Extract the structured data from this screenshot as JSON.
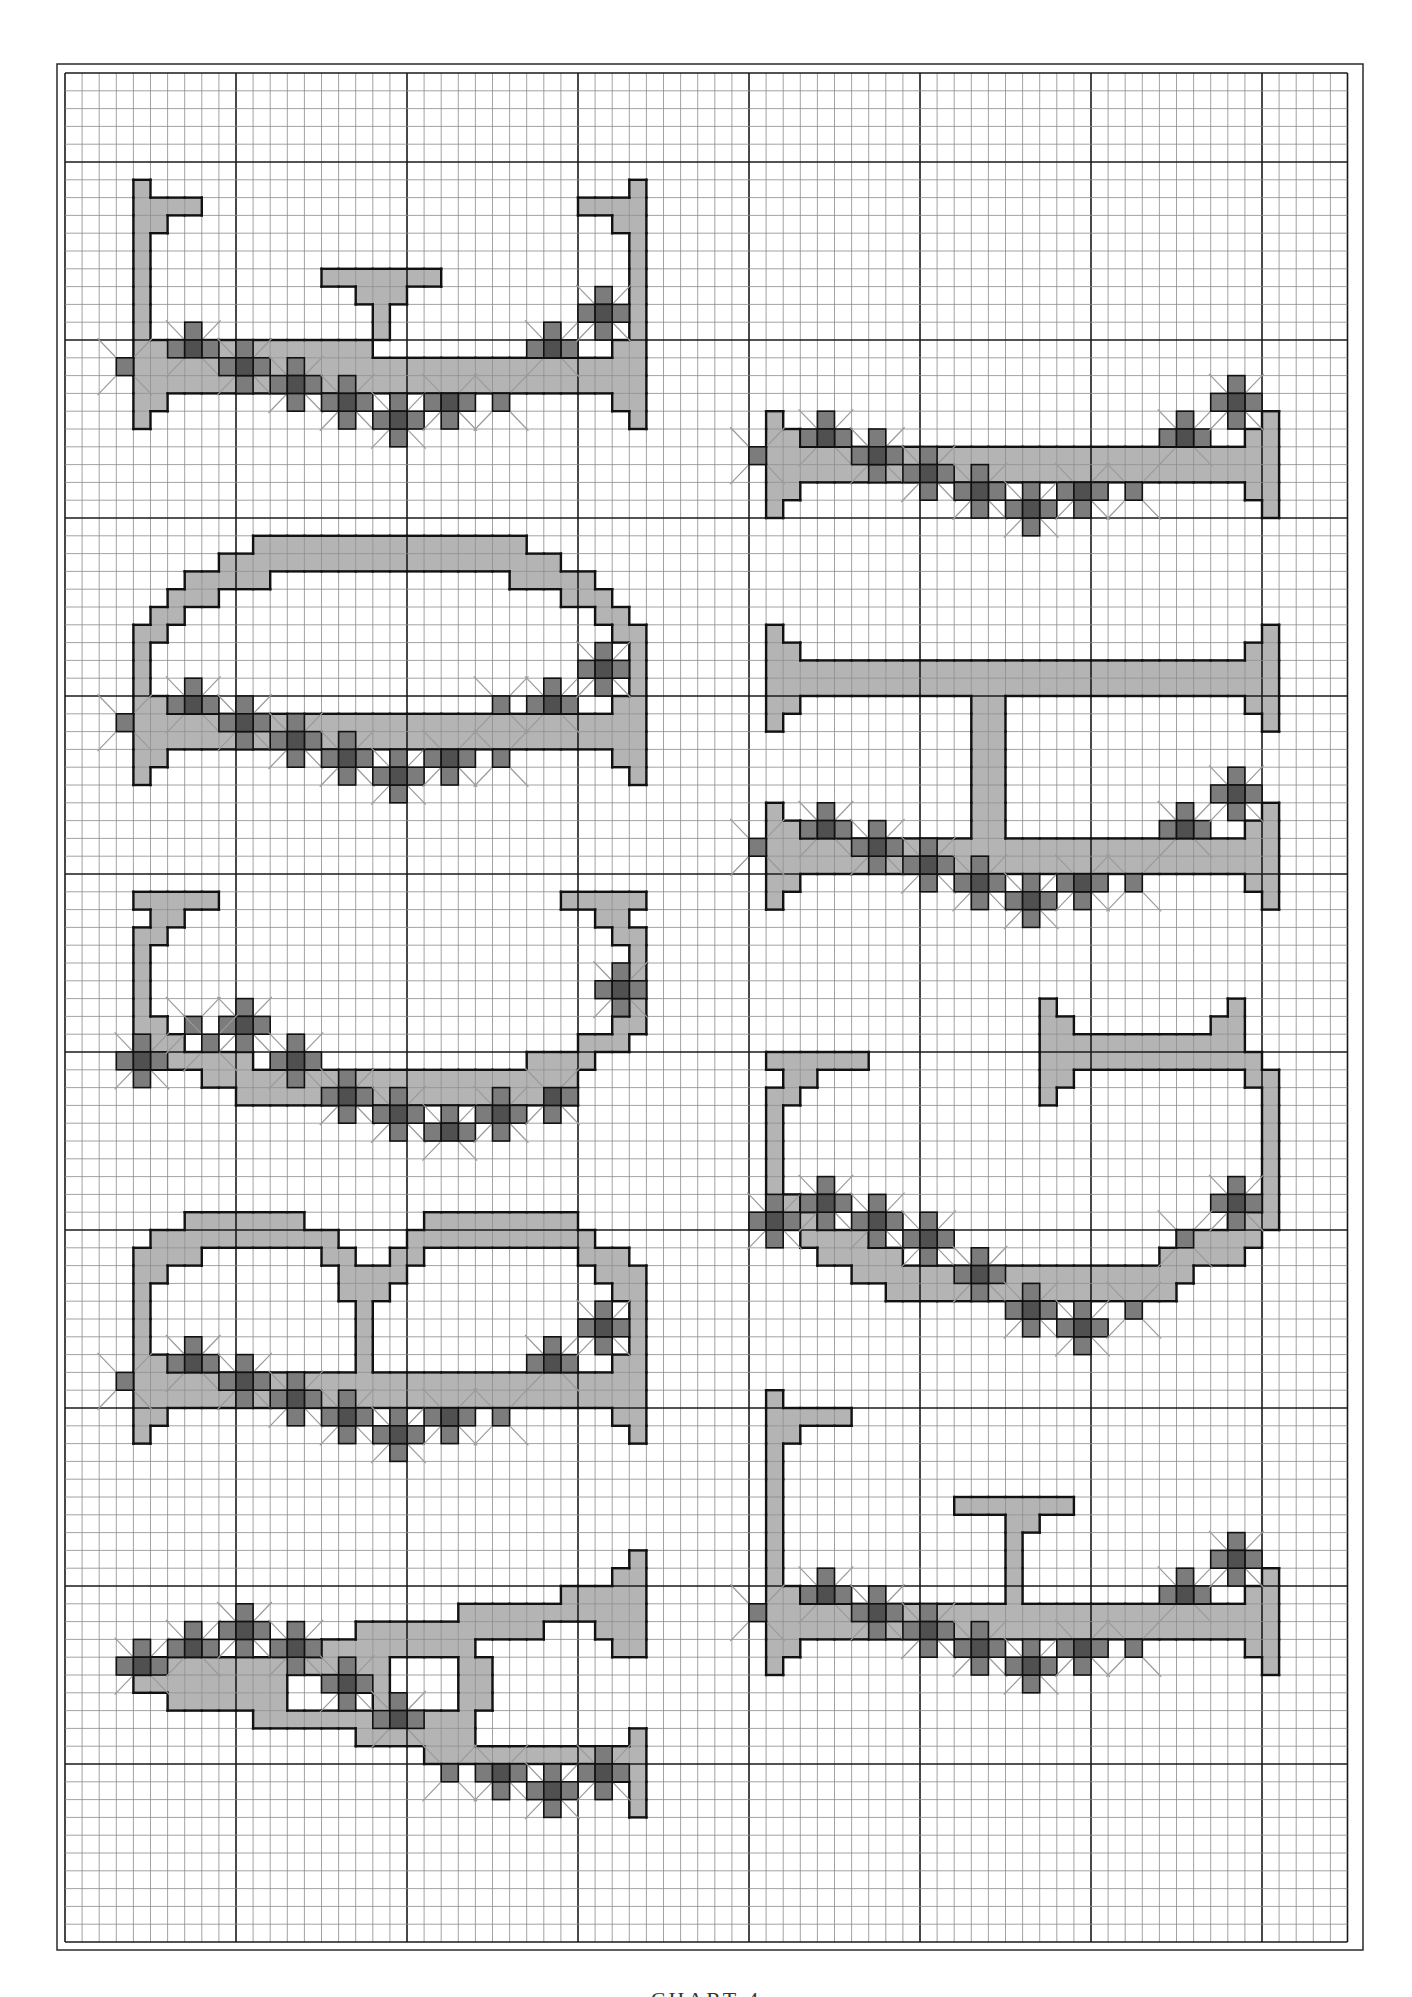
{
  "page": {
    "caption": "CHART 4",
    "colors": {
      "background": "#ffffff",
      "grid_minor": "#8a8a8a",
      "grid_major": "#1a1a1a",
      "frame": "#2a2a2a",
      "fill_light": "#b4b4b4",
      "stitch_medium": "#7c7c7c",
      "stitch_dark": "#505050",
      "outline": "#111111",
      "backstitch": "#9a9a9a"
    }
  },
  "grid": {
    "x0": 65,
    "y0": 73,
    "cell_w": 17.1,
    "cell_h": 17.8,
    "cols": 75,
    "rows": 105,
    "major_every": 10,
    "major_row_offset": 5,
    "frame": {
      "x": 57,
      "y": 64,
      "w": 1306,
      "h": 1886
    }
  },
  "flower_pattern": {
    "description": "shared border of flower clusters relative to (origin col, bar row R)",
    "singles": [
      [
        0,
        0
      ],
      [
        22,
        2
      ]
    ],
    "flowers": [
      [
        4,
        -1,
        "tlr"
      ],
      [
        7,
        0,
        "tlrb"
      ],
      [
        10,
        1,
        "tlrb"
      ],
      [
        13,
        2,
        "tlrb"
      ],
      [
        16,
        3,
        "tlrb"
      ],
      [
        19,
        2,
        "lrb"
      ],
      [
        25,
        -1,
        "tlr"
      ],
      [
        28,
        -3,
        "tlrb"
      ]
    ],
    "bench_spans": [
      [
        0,
        1,
        30
      ],
      [
        1,
        1,
        30
      ],
      [
        -1,
        1,
        2
      ],
      [
        -1,
        29,
        30
      ],
      [
        2,
        1,
        2
      ],
      [
        2,
        29,
        30
      ],
      [
        3,
        1,
        1
      ],
      [
        3,
        30,
        30
      ],
      [
        -2,
        1,
        1
      ],
      [
        -2,
        30,
        30
      ]
    ]
  },
  "motifs": [
    {
      "name": "bench-t-top-left",
      "col": 3,
      "R": 16,
      "pattern": true,
      "spans": [
        [
          -10,
          1,
          1
        ],
        [
          -9,
          1,
          4
        ],
        [
          -8,
          1,
          2
        ],
        [
          -7,
          1,
          1
        ],
        [
          -6,
          1,
          1
        ],
        [
          -5,
          1,
          1
        ],
        [
          -4,
          1,
          1
        ],
        [
          -3,
          1,
          1
        ],
        [
          -10,
          30,
          30
        ],
        [
          -9,
          27,
          30
        ],
        [
          -8,
          29,
          30
        ],
        [
          -7,
          30,
          30
        ],
        [
          -6,
          30,
          30
        ],
        [
          -5,
          30,
          30
        ],
        [
          -4,
          30,
          30
        ],
        [
          -3,
          30,
          30
        ],
        [
          -5,
          12,
          18
        ],
        [
          -4,
          14,
          16
        ],
        [
          -3,
          15,
          15
        ],
        [
          -2,
          15,
          15
        ],
        [
          -1,
          1,
          14
        ]
      ],
      "flowers": [],
      "singles": []
    },
    {
      "name": "bench-right-1",
      "col": 40,
      "R": 21,
      "pattern": true,
      "spans": [],
      "flowers": [],
      "singles": []
    },
    {
      "name": "bench-arch-left",
      "col": 3,
      "R": 36,
      "pattern": true,
      "spans": [
        [
          -10,
          8,
          23
        ],
        [
          -9,
          6,
          25
        ],
        [
          -8,
          4,
          8
        ],
        [
          -8,
          23,
          27
        ],
        [
          -7,
          3,
          5
        ],
        [
          -7,
          26,
          28
        ],
        [
          -6,
          2,
          3
        ],
        [
          -6,
          28,
          29
        ],
        [
          -5,
          1,
          2
        ],
        [
          -5,
          29,
          30
        ],
        [
          -4,
          1,
          1
        ],
        [
          -4,
          30,
          30
        ],
        [
          -3,
          1,
          1
        ],
        [
          -3,
          30,
          30
        ]
      ],
      "flowers": [],
      "singles": [
        [
          22,
          -1
        ]
      ]
    },
    {
      "name": "bench-h-frame-right",
      "col": 40,
      "R": 43,
      "pattern": true,
      "spans": [
        [
          -12,
          1,
          1
        ],
        [
          -11,
          1,
          2
        ],
        [
          -10,
          1,
          30
        ],
        [
          -9,
          1,
          30
        ],
        [
          -8,
          1,
          2
        ],
        [
          -7,
          1,
          1
        ],
        [
          -12,
          30,
          30
        ],
        [
          -11,
          29,
          30
        ],
        [
          -8,
          29,
          30
        ],
        [
          -7,
          30,
          30
        ],
        [
          -8,
          13,
          14
        ],
        [
          -7,
          13,
          14
        ],
        [
          -6,
          13,
          14
        ],
        [
          -5,
          13,
          14
        ],
        [
          -4,
          13,
          14
        ],
        [
          -3,
          13,
          14
        ],
        [
          -2,
          13,
          14
        ],
        [
          -1,
          13,
          14
        ]
      ],
      "flowers": [],
      "singles": []
    },
    {
      "name": "bowl-left",
      "col": 3,
      "R": 55,
      "pattern": false,
      "spans": [
        [
          -9,
          1,
          5
        ],
        [
          -9,
          26,
          30
        ],
        [
          -8,
          2,
          3
        ],
        [
          -8,
          28,
          29
        ],
        [
          -7,
          1,
          2
        ],
        [
          -7,
          29,
          30
        ],
        [
          -6,
          1,
          1
        ],
        [
          -6,
          30,
          30
        ],
        [
          -5,
          1,
          1
        ],
        [
          -5,
          30,
          30
        ],
        [
          -4,
          1,
          1
        ],
        [
          -4,
          30,
          30
        ],
        [
          -3,
          1,
          1
        ],
        [
          -3,
          30,
          30
        ],
        [
          -2,
          1,
          2
        ],
        [
          -2,
          29,
          30
        ],
        [
          -1,
          1,
          3
        ],
        [
          -1,
          27,
          29
        ],
        [
          0,
          2,
          7
        ],
        [
          0,
          24,
          27
        ],
        [
          1,
          5,
          26
        ],
        [
          2,
          7,
          26
        ]
      ],
      "flowers": [
        [
          1,
          0,
          "tlrb"
        ],
        [
          7,
          -2,
          "tlrb"
        ],
        [
          10,
          0,
          "tlrb"
        ],
        [
          13,
          2,
          "tlrb"
        ],
        [
          16,
          3,
          "tlrb"
        ],
        [
          19,
          4,
          "tlr"
        ],
        [
          22,
          3,
          "tlrb"
        ],
        [
          25,
          2,
          "rb"
        ],
        [
          29,
          -4,
          "tlrb"
        ]
      ],
      "singles": [
        [
          4,
          -2
        ],
        [
          5,
          -1
        ]
      ]
    },
    {
      "name": "hoop-h-top-right",
      "col": 40,
      "R": 64,
      "pattern": false,
      "spans": [
        [
          -12,
          17,
          17
        ],
        [
          -12,
          28,
          28
        ],
        [
          -11,
          17,
          18
        ],
        [
          -11,
          27,
          28
        ],
        [
          -10,
          17,
          28
        ],
        [
          -9,
          17,
          29
        ],
        [
          -8,
          17,
          18
        ],
        [
          -8,
          29,
          30
        ],
        [
          -7,
          17,
          17
        ],
        [
          -7,
          30,
          30
        ],
        [
          -9,
          1,
          6
        ],
        [
          -8,
          2,
          3
        ],
        [
          -7,
          1,
          2
        ],
        [
          -6,
          1,
          1
        ],
        [
          -6,
          30,
          30
        ],
        [
          -5,
          1,
          1
        ],
        [
          -5,
          30,
          30
        ],
        [
          -4,
          1,
          1
        ],
        [
          -4,
          30,
          30
        ],
        [
          -3,
          1,
          1
        ],
        [
          -3,
          30,
          30
        ],
        [
          -2,
          1,
          1
        ],
        [
          -2,
          30,
          30
        ],
        [
          -1,
          1,
          2
        ],
        [
          -1,
          30,
          30
        ],
        [
          0,
          1,
          3
        ],
        [
          0,
          28,
          30
        ],
        [
          1,
          3,
          6
        ],
        [
          1,
          25,
          29
        ],
        [
          2,
          4,
          8
        ],
        [
          2,
          24,
          28
        ],
        [
          3,
          6,
          25
        ],
        [
          4,
          8,
          24
        ]
      ],
      "flowers": [
        [
          1,
          0,
          "tlrb"
        ],
        [
          4,
          -1,
          "tlrb"
        ],
        [
          7,
          0,
          "tlrb"
        ],
        [
          10,
          1,
          "tlrb"
        ],
        [
          13,
          3,
          "tlrb"
        ],
        [
          16,
          5,
          "tlrb"
        ],
        [
          19,
          6,
          "tlrb"
        ],
        [
          28,
          -1,
          "tlrb"
        ]
      ],
      "singles": [
        [
          22,
          5
        ],
        [
          25,
          1
        ]
      ]
    },
    {
      "name": "double-arch-left",
      "col": 3,
      "R": 73,
      "pattern": true,
      "spans": [
        [
          -9,
          4,
          10
        ],
        [
          -9,
          18,
          26
        ],
        [
          -8,
          2,
          12
        ],
        [
          -8,
          17,
          27
        ],
        [
          -7,
          1,
          4
        ],
        [
          -7,
          12,
          13
        ],
        [
          -7,
          16,
          17
        ],
        [
          -7,
          27,
          29
        ],
        [
          -6,
          1,
          2
        ],
        [
          -6,
          13,
          16
        ],
        [
          -6,
          28,
          30
        ],
        [
          -5,
          1,
          1
        ],
        [
          -5,
          13,
          15
        ],
        [
          -5,
          29,
          30
        ],
        [
          -4,
          1,
          1
        ],
        [
          -4,
          14,
          14
        ],
        [
          -4,
          30,
          30
        ],
        [
          -3,
          1,
          1
        ],
        [
          -3,
          14,
          14
        ],
        [
          -3,
          30,
          30
        ],
        [
          -2,
          1,
          1
        ],
        [
          -2,
          14,
          14
        ],
        [
          -2,
          30,
          30
        ],
        [
          -1,
          14,
          14
        ]
      ],
      "flowers": [],
      "singles": []
    },
    {
      "name": "diagonal-bench-left",
      "col": 3,
      "R": 89,
      "pattern": false,
      "spans": [
        [
          -6,
          30,
          30
        ],
        [
          -5,
          29,
          30
        ],
        [
          -4,
          26,
          30
        ],
        [
          -3,
          20,
          30
        ],
        [
          -2,
          14,
          24
        ],
        [
          -2,
          28,
          30
        ],
        [
          -1,
          12,
          20
        ],
        [
          -1,
          29,
          30
        ],
        [
          0,
          2,
          15
        ],
        [
          0,
          20,
          21
        ],
        [
          1,
          1,
          9
        ],
        [
          1,
          13,
          15
        ],
        [
          1,
          20,
          21
        ],
        [
          2,
          3,
          9
        ],
        [
          2,
          15,
          15
        ],
        [
          2,
          20,
          21
        ],
        [
          3,
          8,
          20
        ],
        [
          4,
          14,
          20
        ],
        [
          5,
          18,
          29
        ],
        [
          4,
          30,
          30
        ],
        [
          5,
          30,
          30
        ],
        [
          6,
          29,
          30
        ],
        [
          7,
          30,
          30
        ],
        [
          8,
          30,
          30
        ]
      ],
      "flowers": [
        [
          1,
          0,
          "tlr"
        ],
        [
          4,
          -1,
          "tlr"
        ],
        [
          7,
          -2,
          "tlrb"
        ],
        [
          10,
          -1,
          "tlrb"
        ],
        [
          13,
          1,
          "tlrb"
        ],
        [
          16,
          3,
          "tlr"
        ],
        [
          22,
          6,
          "lrb"
        ],
        [
          25,
          7,
          "tlrb"
        ],
        [
          28,
          6,
          "tlrb"
        ]
      ],
      "singles": [
        [
          19,
          6
        ]
      ]
    },
    {
      "name": "bench-t-post-right",
      "col": 40,
      "R": 86,
      "pattern": true,
      "spans": [
        [
          -12,
          1,
          1
        ],
        [
          -11,
          1,
          5
        ],
        [
          -10,
          1,
          2
        ],
        [
          -9,
          1,
          1
        ],
        [
          -8,
          1,
          1
        ],
        [
          -7,
          1,
          1
        ],
        [
          -6,
          1,
          1
        ],
        [
          -5,
          1,
          1
        ],
        [
          -4,
          1,
          1
        ],
        [
          -3,
          1,
          1
        ],
        [
          -6,
          12,
          18
        ],
        [
          -5,
          15,
          16
        ],
        [
          -4,
          15,
          15
        ],
        [
          -3,
          15,
          15
        ],
        [
          -2,
          15,
          15
        ],
        [
          -1,
          15,
          15
        ]
      ],
      "flowers": [],
      "singles": []
    }
  ]
}
